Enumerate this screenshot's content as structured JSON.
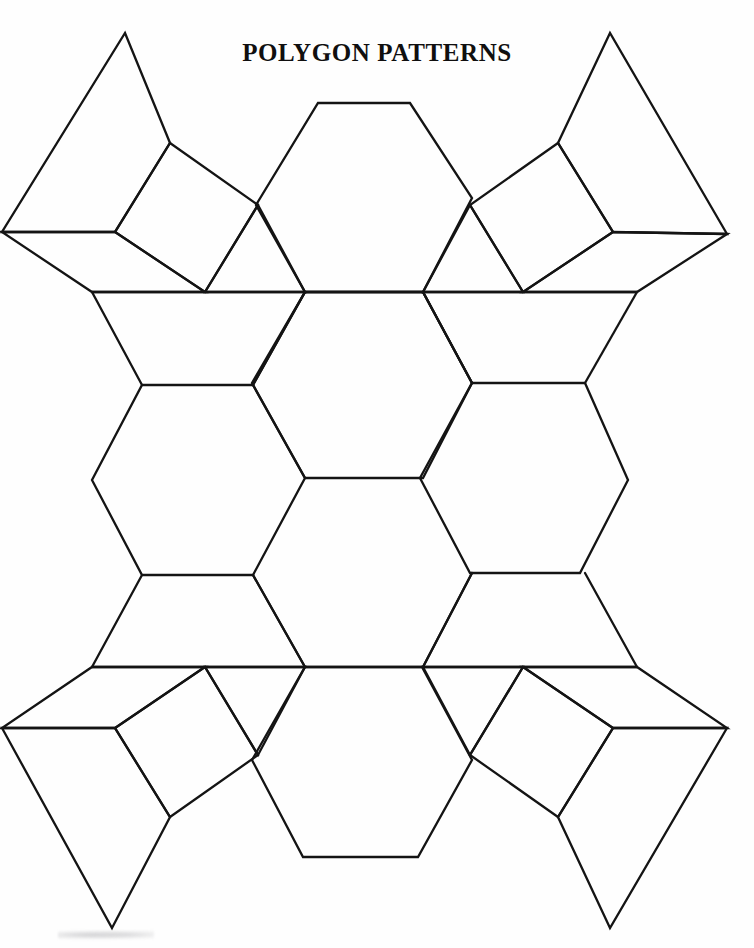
{
  "document": {
    "title": "Polygon Patterns",
    "title_display": "POLYGON PATTERNS",
    "page_background": "#fefefe",
    "ink_color": "#141414",
    "width": 754,
    "height": 948
  },
  "figure": {
    "name": "polygon-net",
    "stroke_color": "#141414",
    "stroke_width": 2.3,
    "fill": "none",
    "shapes": [
      {
        "name": "hexagon-top-center",
        "type": "hexagon",
        "points": "318,103 410,103 472,198 423,292 305,292 256,205"
      },
      {
        "name": "hexagon-middle-left",
        "type": "hexagon",
        "points": "142,385 253,385 305,478 253,575 142,575 92,480"
      },
      {
        "name": "hexagon-middle-center",
        "type": "hexagon",
        "points": "305,292 423,292 472,383 423,478 305,478 252,383"
      },
      {
        "name": "hexagon-middle-right",
        "type": "hexagon",
        "points": "472,383 585,383 628,480 580,573 470,573 420,478"
      },
      {
        "name": "hexagon-bottom-center",
        "type": "hexagon",
        "points": "305,667 422,667 472,760 418,857 303,857 252,760"
      },
      {
        "name": "square-top-left",
        "type": "square",
        "points": "170,143 258,205 205,292 115,232"
      },
      {
        "name": "square-top-right",
        "type": "square",
        "points": "558,143 470,205 523,292 613,232"
      },
      {
        "name": "square-bottom-left",
        "type": "square",
        "points": "170,817 258,755 205,667 115,728"
      },
      {
        "name": "square-bottom-right",
        "type": "square",
        "points": "558,817 470,755 523,667 613,728"
      },
      {
        "name": "triangle-top-left-inner",
        "type": "triangle",
        "points": "258,205 305,292 205,292"
      },
      {
        "name": "triangle-top-right-inner",
        "type": "triangle",
        "points": "470,205 423,292 523,292"
      },
      {
        "name": "triangle-bottom-left-inner",
        "type": "triangle",
        "points": "258,755 205,667 305,667"
      },
      {
        "name": "triangle-bottom-right-inner",
        "type": "triangle",
        "points": "470,755 523,667 423,667"
      },
      {
        "name": "kite-top-left-outer",
        "type": "kite",
        "points": "125,33 170,143 115,232 2,232"
      },
      {
        "name": "kite-top-right-outer",
        "type": "kite",
        "points": "610,33 558,143 613,232 727,234"
      },
      {
        "name": "kite-bottom-left-outer",
        "type": "kite",
        "points": "112,928 170,817 115,728 2,728"
      },
      {
        "name": "kite-bottom-right-outer",
        "type": "kite",
        "points": "610,928 558,817 613,728 727,728"
      },
      {
        "name": "quad-upper-left-wedge",
        "type": "quadrilateral",
        "points": "2,232 115,232 205,292 92,292"
      },
      {
        "name": "quad-upper-right-wedge",
        "type": "quadrilateral",
        "points": "727,234 613,232 523,292 637,292"
      },
      {
        "name": "quad-lower-left-wedge",
        "type": "quadrilateral",
        "points": "2,728 115,728 205,667 92,667"
      },
      {
        "name": "quad-lower-right-wedge",
        "type": "quadrilateral",
        "points": "727,728 613,728 523,667 637,667"
      },
      {
        "name": "band-upper-horizontal",
        "type": "line",
        "points": "92,292 637,292"
      },
      {
        "name": "band-lower-horizontal",
        "type": "line",
        "points": "92,667 637,667"
      },
      {
        "name": "edge-upper-left-diag-a",
        "type": "line",
        "points": "92,292 142,385"
      },
      {
        "name": "edge-upper-left-diag-b",
        "type": "line",
        "points": "305,292 253,385"
      },
      {
        "name": "edge-upper-right-diag-a",
        "type": "line",
        "points": "637,292 585,383"
      },
      {
        "name": "edge-upper-right-diag-b",
        "type": "line",
        "points": "423,292 472,383"
      },
      {
        "name": "edge-lower-left-diag-a",
        "type": "line",
        "points": "92,667 142,575"
      },
      {
        "name": "edge-lower-left-diag-b",
        "type": "line",
        "points": "305,667 253,575"
      },
      {
        "name": "edge-lower-right-diag-a",
        "type": "line",
        "points": "637,667 585,573"
      },
      {
        "name": "edge-lower-right-diag-b",
        "type": "line",
        "points": "423,667 472,573"
      },
      {
        "name": "edge-mid-left-up",
        "type": "line",
        "points": "253,385 305,292"
      },
      {
        "name": "edge-mid-right-up",
        "type": "line",
        "points": "472,383 423,292"
      },
      {
        "name": "edge-mid-left-down",
        "type": "line",
        "points": "253,575 305,667"
      },
      {
        "name": "edge-mid-right-down",
        "type": "line",
        "points": "472,573 423,667"
      }
    ]
  },
  "artifacts": {
    "smudge_label": ""
  }
}
